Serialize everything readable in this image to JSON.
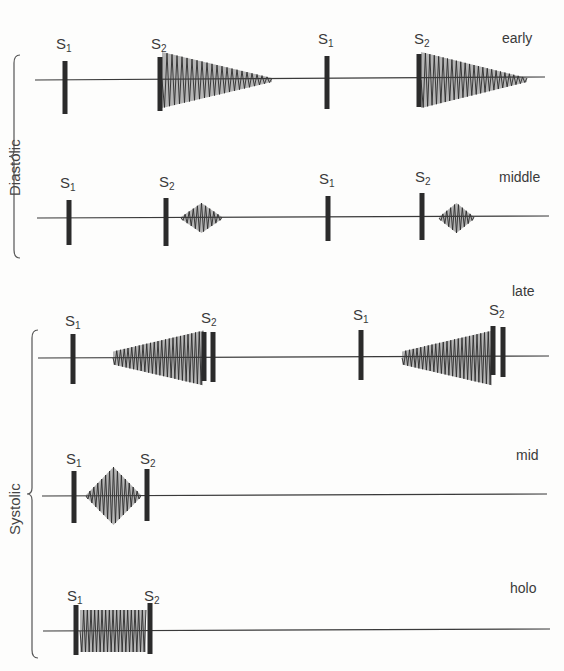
{
  "groups": [
    {
      "name": "diastolic",
      "label": "Diastolic",
      "label_x": 6,
      "label_y": 196,
      "brace": {
        "x": 14,
        "y1": 55,
        "y2": 258
      }
    },
    {
      "name": "systolic",
      "label": "Systolic",
      "label_x": 6,
      "label_y": 535,
      "brace": {
        "x": 32,
        "y1": 330,
        "y2": 658
      }
    }
  ],
  "rows": [
    {
      "name": "early",
      "label": "early",
      "label_x": 502,
      "label_y": 30,
      "line": {
        "x1": 35,
        "x2": 545,
        "y": 80
      },
      "markers": [
        {
          "id": "S",
          "sub": "1",
          "x": 65,
          "tx": 56,
          "ty": 36,
          "top": 61,
          "bot": 114
        },
        {
          "id": "S",
          "sub": "2",
          "x": 160,
          "tx": 151,
          "ty": 36,
          "top": 57,
          "bot": 111
        },
        {
          "id": "S",
          "sub": "1",
          "x": 327,
          "tx": 318,
          "ty": 31,
          "top": 56,
          "bot": 109
        },
        {
          "id": "S",
          "sub": "2",
          "x": 419,
          "tx": 414,
          "ty": 31,
          "top": 54,
          "bot": 107
        }
      ],
      "murmurs": [
        {
          "shape": "decrescendo",
          "x1": 162,
          "x2": 272,
          "h": 26,
          "n": 22
        },
        {
          "shape": "decrescendo",
          "x1": 421,
          "x2": 527,
          "h": 26,
          "n": 24
        }
      ]
    },
    {
      "name": "middle",
      "label": "middle",
      "label_x": 499,
      "label_y": 169,
      "line": {
        "x1": 37,
        "x2": 549,
        "y": 218
      },
      "markers": [
        {
          "id": "S",
          "sub": "1",
          "x": 69,
          "tx": 60,
          "ty": 175,
          "top": 200,
          "bot": 245
        },
        {
          "id": "S",
          "sub": "2",
          "x": 166,
          "tx": 159,
          "ty": 174,
          "top": 198,
          "bot": 246
        },
        {
          "id": "S",
          "sub": "1",
          "x": 328,
          "tx": 319,
          "ty": 171,
          "top": 196,
          "bot": 241
        },
        {
          "id": "S",
          "sub": "2",
          "x": 422,
          "tx": 415,
          "ty": 169,
          "top": 193,
          "bot": 240
        }
      ],
      "murmurs": [
        {
          "shape": "diamond",
          "x1": 181,
          "x2": 222,
          "h": 14,
          "n": 10
        },
        {
          "shape": "diamond",
          "x1": 439,
          "x2": 474,
          "h": 14,
          "n": 9
        }
      ]
    },
    {
      "name": "late",
      "label": "late",
      "label_x": 512,
      "label_y": 283,
      "line": {
        "x1": 38,
        "x2": 549,
        "y": 358
      },
      "markers": [
        {
          "id": "S",
          "sub": "1",
          "x": 73,
          "tx": 65,
          "ty": 313,
          "top": 334,
          "bot": 384
        },
        {
          "id": "S",
          "sub": "2",
          "x": 204,
          "tx": 201,
          "ty": 310,
          "top": 332,
          "bot": 381
        },
        {
          "id": "S",
          "sub": "2b",
          "x": 213,
          "tx": -100,
          "ty": 0,
          "top": 332,
          "bot": 382
        },
        {
          "id": "S",
          "sub": "1",
          "x": 361,
          "tx": 353,
          "ty": 307,
          "top": 330,
          "bot": 380
        },
        {
          "id": "S",
          "sub": "2",
          "x": 493,
          "tx": 489,
          "ty": 302,
          "top": 326,
          "bot": 375
        },
        {
          "id": "S",
          "sub": "2b",
          "x": 503,
          "tx": -100,
          "ty": 0,
          "top": 327,
          "bot": 377
        }
      ],
      "murmurs": [
        {
          "shape": "crescendo",
          "x1": 113,
          "x2": 203,
          "h": 26,
          "n": 24
        },
        {
          "shape": "crescendo",
          "x1": 402,
          "x2": 492,
          "h": 26,
          "n": 24
        }
      ]
    },
    {
      "name": "mid",
      "label": "mid",
      "label_x": 516,
      "label_y": 447,
      "line": {
        "x1": 42,
        "x2": 547,
        "y": 496
      },
      "markers": [
        {
          "id": "S",
          "sub": "1",
          "x": 74,
          "tx": 66,
          "ty": 451,
          "top": 471,
          "bot": 523
        },
        {
          "id": "S",
          "sub": "2",
          "x": 147,
          "tx": 140,
          "ty": 451,
          "top": 469,
          "bot": 521
        }
      ],
      "murmurs": [
        {
          "shape": "diamond",
          "x1": 86,
          "x2": 141,
          "h": 28,
          "n": 14
        }
      ]
    },
    {
      "name": "holo",
      "label": "holo",
      "label_x": 510,
      "label_y": 580,
      "line": {
        "x1": 43,
        "x2": 550,
        "y": 631
      },
      "markers": [
        {
          "id": "S",
          "sub": "1",
          "x": 76,
          "tx": 67,
          "ty": 588,
          "top": 605,
          "bot": 655
        },
        {
          "id": "S",
          "sub": "2",
          "x": 150,
          "tx": 144,
          "ty": 588,
          "top": 603,
          "bot": 654
        }
      ],
      "murmurs": [
        {
          "shape": "plateau",
          "x1": 80,
          "x2": 146,
          "h": 21,
          "n": 18
        }
      ]
    }
  ],
  "colors": {
    "ink": "#2b2b2b",
    "fill": "#b5b5b5",
    "line": "#3a3a3a"
  }
}
